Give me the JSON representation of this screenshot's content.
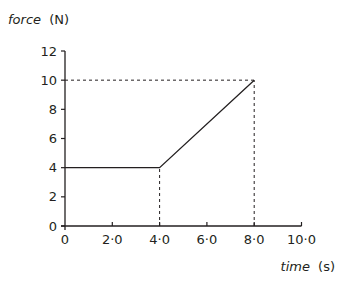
{
  "chart_data": {
    "type": "line",
    "title": "",
    "ylabel": "force",
    "ylabel_unit": "(N)",
    "xlabel": "time",
    "xlabel_unit": "(s)",
    "xlim": [
      0,
      10
    ],
    "ylim": [
      0,
      12
    ],
    "xticks": [
      0,
      2,
      4,
      6,
      8,
      10
    ],
    "xtick_labels": [
      "0",
      "2·0",
      "4·0",
      "6·0",
      "8·0",
      "10·0"
    ],
    "yticks": [
      0,
      2,
      4,
      6,
      8,
      10,
      12
    ],
    "ytick_labels": [
      "0",
      "2",
      "4",
      "6",
      "8",
      "10",
      "12"
    ],
    "grid": false,
    "legend": null,
    "series": [
      {
        "name": "force",
        "x": [
          0,
          4,
          8
        ],
        "y": [
          4,
          4,
          10
        ]
      }
    ],
    "annotations": [
      {
        "type": "dashed-guide",
        "description": "vertical dashed line from (4,0) to (4,4)"
      },
      {
        "type": "dashed-guide",
        "description": "vertical dashed line from (8,0) to (8,10)"
      },
      {
        "type": "dashed-guide",
        "description": "horizontal dashed line from (0,10) to (8,10)"
      }
    ]
  },
  "labels": {
    "y_axis_name": "force",
    "y_axis_unit": "(N)",
    "x_axis_name": "time",
    "x_axis_unit": "(s)"
  }
}
